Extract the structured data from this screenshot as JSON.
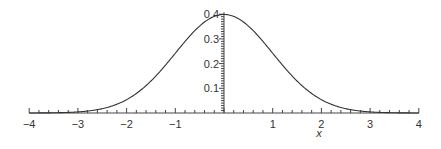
{
  "chart_data": {
    "type": "line",
    "title": "",
    "xlabel": "x",
    "ylabel": "",
    "xlim": [
      -4,
      4
    ],
    "ylim": [
      0,
      0.4
    ],
    "grid": false,
    "legend": null,
    "x_ticks": [
      "-4",
      "-3",
      "-2",
      "-1",
      "1",
      "2",
      "3",
      "4"
    ],
    "y_ticks": [
      "0.1",
      "0.2",
      "0.3",
      "0.4"
    ],
    "series": [
      {
        "name": "standard normal density",
        "function": "exp(-x^2/2)/sqrt(2*pi)",
        "x": [
          -4,
          -3.5,
          -3,
          -2.5,
          -2,
          -1.5,
          -1,
          -0.5,
          0,
          0.5,
          1,
          1.5,
          2,
          2.5,
          3,
          3.5,
          4
        ],
        "values": [
          0.0001,
          0.0009,
          0.0044,
          0.0175,
          0.054,
          0.1295,
          0.242,
          0.3521,
          0.3989,
          0.3521,
          0.242,
          0.1295,
          0.054,
          0.0175,
          0.0044,
          0.0009,
          0.0001
        ]
      }
    ]
  }
}
